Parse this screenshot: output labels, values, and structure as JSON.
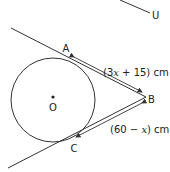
{
  "diagram": {
    "type": "geometry-tangents-to-circle",
    "colors": {
      "line": "#333333",
      "text": "#222222",
      "background": "#ffffff"
    },
    "points": {
      "A": {
        "label": "A"
      },
      "B": {
        "label": "B"
      },
      "C": {
        "label": "C"
      },
      "O": {
        "label": "O"
      },
      "U": {
        "label": "U"
      }
    },
    "measurements": {
      "AB": {
        "prefix": "(3",
        "var": "x",
        "suffix": " + 15) cm"
      },
      "BC": {
        "prefix": "(60 − ",
        "var": "x",
        "suffix": ") cm"
      }
    }
  }
}
